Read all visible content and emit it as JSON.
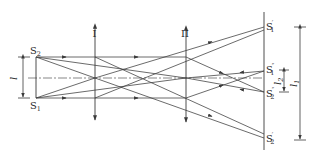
{
  "diagram": {
    "type": "optical ray diagram",
    "colors": {
      "line": "#3a3a3a",
      "background": "#ffffff"
    },
    "sources": [
      {
        "id": "S2",
        "label": "S",
        "sub": "2",
        "x": 36,
        "y": 57
      },
      {
        "id": "S1",
        "label": "S",
        "sub": "1",
        "x": 36,
        "y": 98
      }
    ],
    "lenses": [
      {
        "id": "lens-1",
        "label": "I",
        "x": 95,
        "top": 26,
        "bottom": 121
      },
      {
        "id": "lens-2",
        "label": "II",
        "x": 186,
        "top": 28,
        "bottom": 122
      }
    ],
    "screen": {
      "x": 264,
      "top": 12,
      "bottom": 150
    },
    "images": [
      {
        "id": "S1-prime",
        "label": "S",
        "sub": "1",
        "sup": "′",
        "x": 264,
        "y": 27
      },
      {
        "id": "S1-double-prime",
        "label": "S",
        "sub": "1",
        "sup": "″",
        "x": 264,
        "y": 71
      },
      {
        "id": "S2-double-prime",
        "label": "S",
        "sub": "2",
        "sup": "″",
        "x": 264,
        "y": 92
      },
      {
        "id": "S2-prime",
        "label": "S",
        "sub": "2",
        "sup": "′",
        "x": 264,
        "y": 138
      }
    ],
    "dimensions": [
      {
        "id": "dim-l",
        "label": "l",
        "sub": "",
        "x": 23,
        "y1": 57,
        "y2": 98
      },
      {
        "id": "dim-l2",
        "label": "l",
        "sub": "2",
        "x": 284,
        "y1": 70,
        "y2": 92
      },
      {
        "id": "dim-l1",
        "label": "l",
        "sub": "1",
        "x": 300,
        "y1": 27,
        "y2": 140
      }
    ],
    "axis": {
      "y": 78,
      "x1": 28,
      "x2": 262
    }
  }
}
